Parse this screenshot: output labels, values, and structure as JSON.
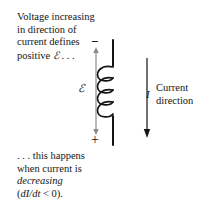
{
  "figure": {
    "kind": "inductor-emf-polarity-diagram",
    "background_color": "#ffffff",
    "stroke_color": "#141414",
    "width": 205,
    "height": 201
  },
  "caption_top": {
    "line1": "Voltage increasing",
    "line2": "in direction of",
    "line3": "current defines",
    "line4_prefix": "positive ",
    "line4_symbol": "ℰ",
    "line4_suffix": " . . ."
  },
  "caption_bottom": {
    "line1": ". . . this happens",
    "line2": "when current is",
    "line3_italic": "decreasing",
    "line4_open": "(",
    "line4_italic": "dI/dt",
    "line4_close": " < 0)."
  },
  "circuit": {
    "emf_symbol": "ℰ",
    "terminal_negative": "−",
    "terminal_positive": "+",
    "coil_turns": 4
  },
  "current": {
    "symbol": "I",
    "caption_line1": "Current",
    "caption_line2": "direction"
  }
}
